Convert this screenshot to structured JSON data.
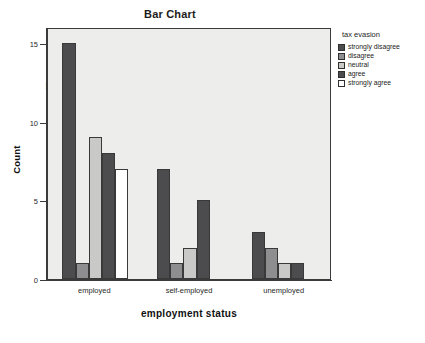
{
  "figure": {
    "title": "Bar Chart"
  },
  "chart_data": {
    "type": "bar",
    "title": "Bar Chart",
    "xlabel": "employment status",
    "ylabel": "Count",
    "categories": [
      "employed",
      "self-employed",
      "unemployed"
    ],
    "ylim": [
      0,
      16
    ],
    "yticks": [
      0,
      5,
      10,
      15
    ],
    "ytick_labels": [
      "0",
      "5",
      "10",
      "15"
    ],
    "grid": false,
    "legend_title": "tax evasion",
    "legend_position": "right",
    "series": [
      {
        "name": "strongly disagree",
        "color": "#4c4c4e",
        "values": [
          15,
          7,
          3
        ]
      },
      {
        "name": "disagree",
        "color": "#8e8e90",
        "values": [
          1,
          1,
          2
        ]
      },
      {
        "name": "neutral",
        "color": "#c9c9c7",
        "values": [
          9,
          2,
          1
        ]
      },
      {
        "name": "agree",
        "color": "#4c4c4e",
        "values": [
          8,
          5,
          1
        ]
      },
      {
        "name": "strongly agree",
        "color": "#fefefe",
        "values": [
          7,
          0,
          0
        ]
      }
    ]
  },
  "scan_bleed": {
    "lines": [
      {
        "text": "the possibility",
        "x": 228,
        "y": 30,
        "size": 11
      },
      {
        "text": "and a  significant outcome for both",
        "x": 55,
        "y": 62,
        "size": 13
      },
      {
        "text": "mpling from the initial 200 responding subjects",
        "x": 45,
        "y": 78,
        "size": 12
      },
      {
        "text": "the blocks - to set to our earlier discussion of",
        "x": 52,
        "y": 94,
        "size": 12
      },
      {
        "text": "a  employment. The",
        "x": 92,
        "y": 128,
        "size": 13
      },
      {
        "text": "recoding the procedure might of a research",
        "x": 62,
        "y": 144,
        "size": 12
      },
      {
        "text": "of 25 and those through time and the measure",
        "x": 52,
        "y": 160,
        "size": 12
      },
      {
        "text": "the approach into our own findings as part",
        "x": 62,
        "y": 176,
        "size": 12
      },
      {
        "text": "the it cases that by subject to the table 11",
        "x": 58,
        "y": 192,
        "size": 12
      },
      {
        "text": "the same of the result of a sample producing",
        "x": 54,
        "y": 208,
        "size": 12
      },
      {
        "text": "a scale of measurement was how the total",
        "x": 58,
        "y": 224,
        "size": 12
      },
      {
        "text": "a unique and the size that the second",
        "x": 66,
        "y": 240,
        "size": 12
      },
      {
        "text": "the recoded the measure in terms of",
        "x": 50,
        "y": 256,
        "size": 12
      }
    ]
  }
}
